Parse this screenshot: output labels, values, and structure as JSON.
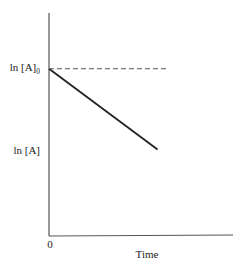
{
  "chart_data": {
    "type": "line",
    "title": "",
    "xlabel": "Time",
    "ylabel": "",
    "x_tick_labels": [
      "0"
    ],
    "y_tick_labels": [
      {
        "text": "ln [A]",
        "subscript": "0",
        "value": 1.0
      },
      {
        "text": "ln [A]",
        "subscript": "",
        "value": 0.42
      }
    ],
    "xlim": [
      0,
      1
    ],
    "ylim": [
      -0.2,
      1.4
    ],
    "grid": false,
    "legend": "none",
    "series": [
      {
        "name": "ln[A] vs time",
        "style": "solid",
        "color": "#222222",
        "x": [
          0,
          0.59
        ],
        "y": [
          1.0,
          0.42
        ]
      },
      {
        "name": "ln[A]0 reference",
        "style": "dashed",
        "color": "#555555",
        "x": [
          0,
          0.65
        ],
        "y": [
          1.0,
          1.0
        ]
      }
    ]
  }
}
